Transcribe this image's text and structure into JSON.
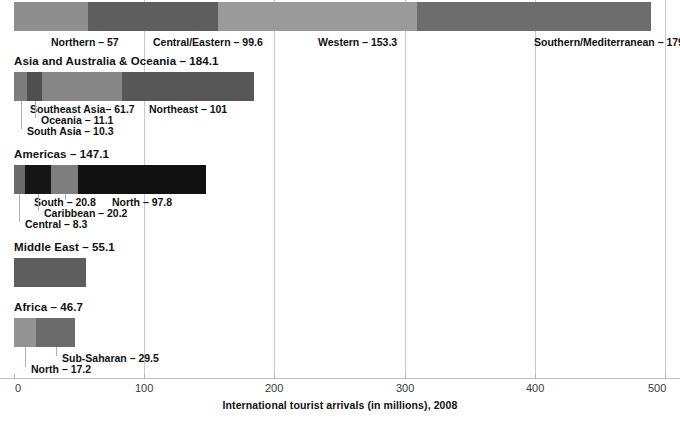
{
  "chart_data": {
    "type": "bar",
    "orientation": "horizontal",
    "stacked": true,
    "title": "",
    "xlabel": "International tourist arrivals (in millions), 2008",
    "ylabel": "",
    "xlim": [
      0,
      500
    ],
    "xticks": [
      0,
      100,
      200,
      300,
      400,
      500
    ],
    "xticklabels": [
      "0",
      "100",
      "200",
      "300",
      "400",
      "500"
    ],
    "grid": true,
    "legend": "none",
    "units": "millions",
    "year": 2008,
    "groups": [
      {
        "name": "Europe",
        "heading": "",
        "total": 489.5,
        "show_heading": false,
        "segments": [
          {
            "label": "Northern",
            "value": 57,
            "display": "Northern – 57",
            "color": "#8e8e8e"
          },
          {
            "label": "Central/Eastern",
            "value": 99.6,
            "display": "Central/Eastern – 99.6",
            "color": "#5e5e5e"
          },
          {
            "label": "Western",
            "value": 153.3,
            "display": "Western – 153.3",
            "color": "#9a9a9a"
          },
          {
            "label": "Southern/Mediterranean",
            "value": 179.6,
            "display": "Southern/Mediterranean – 179.6",
            "color": "#6d6d6d"
          }
        ]
      },
      {
        "name": "Asia and Australia & Oceania",
        "heading": "Asia and Australia & Oceania – 184.1",
        "total": 184.1,
        "show_heading": true,
        "segments": [
          {
            "label": "South Asia",
            "value": 10.3,
            "display": "South Asia – 10.3",
            "color": "#7d7d7d"
          },
          {
            "label": "Oceania",
            "value": 11.1,
            "display": "Oceania – 11.1",
            "color": "#4f4f4f"
          },
          {
            "label": "Southeast Asia",
            "value": 61.7,
            "display": "Southeast Asia– 61.7",
            "color": "#868686"
          },
          {
            "label": "Northeast",
            "value": 101,
            "display": "Northeast – 101",
            "color": "#575757"
          }
        ]
      },
      {
        "name": "Americas",
        "heading": "Americas – 147.1",
        "total": 147.1,
        "show_heading": true,
        "segments": [
          {
            "label": "Central",
            "value": 8.3,
            "display": "Central – 8.3",
            "color": "#6a6a6a"
          },
          {
            "label": "Caribbean",
            "value": 20.2,
            "display": "Caribbean – 20.2",
            "color": "#161616"
          },
          {
            "label": "South",
            "value": 20.8,
            "display": "South – 20.8",
            "color": "#7e7e7e"
          },
          {
            "label": "North",
            "value": 97.8,
            "display": "North – 97.8",
            "color": "#111111"
          }
        ]
      },
      {
        "name": "Middle East",
        "heading": "Middle East – 55.1",
        "total": 55.1,
        "show_heading": true,
        "segments": [
          {
            "label": "Middle East",
            "value": 55.1,
            "display": "",
            "color": "#5e5e5e"
          }
        ]
      },
      {
        "name": "Africa",
        "heading": "Africa – 46.7",
        "total": 46.7,
        "show_heading": true,
        "segments": [
          {
            "label": "North",
            "value": 17.2,
            "display": "North – 17.2",
            "color": "#939393"
          },
          {
            "label": "Sub-Saharan",
            "value": 29.5,
            "display": "Sub-Saharan – 29.5",
            "color": "#6b6b6b"
          }
        ]
      }
    ]
  }
}
